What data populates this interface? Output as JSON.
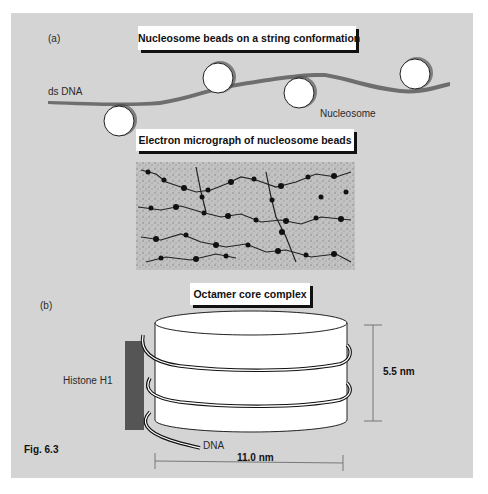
{
  "figure": {
    "caption": "Fig. 6.3",
    "panel_a": {
      "label": "(a)",
      "title": "Nucleosome beads on a string conformation",
      "dna_label": "ds DNA",
      "nucleosome_label": "Nucleosome",
      "micrograph_title": "Electron micrograph of nucleosome beads"
    },
    "panel_b": {
      "label": "(b)",
      "title": "Octamer core complex",
      "histone_label": "Histone H1",
      "dna_label": "DNA",
      "height_label": "5.5 nm",
      "width_label": "11.0 nm"
    },
    "colors": {
      "background_panel": "#d4d4d4",
      "dna_strand": "#6e6e6e",
      "histone_h1": "#555555",
      "bead_fill": "#ffffff",
      "text": "#111111"
    }
  }
}
